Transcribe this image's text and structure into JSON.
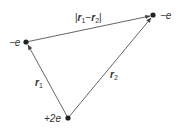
{
  "diagram": {
    "type": "vector-triangle",
    "charges": [
      {
        "id": "left",
        "label": "−e",
        "x": 26,
        "y": 42
      },
      {
        "id": "right",
        "label": "−e",
        "x": 153,
        "y": 15
      },
      {
        "id": "bottom",
        "label": "+2e",
        "x": 68,
        "y": 118
      }
    ],
    "vectors": [
      {
        "id": "r1",
        "label": "r",
        "sub": "1",
        "from": "bottom",
        "to": "left"
      },
      {
        "id": "r2",
        "label": "r",
        "sub": "2",
        "from": "bottom",
        "to": "right"
      },
      {
        "id": "r12",
        "label": "|r1−r2|",
        "from": "left",
        "to": "right"
      }
    ],
    "labels": {
      "left_charge": "−e",
      "right_charge": "−e",
      "bottom_charge": "+2e",
      "r1": "r",
      "r1_sub": "1",
      "r2": "r",
      "r2_sub": "2",
      "diff_bar_left": "|",
      "diff_r1": "r",
      "diff_r1_sub": "1",
      "diff_minus": "−",
      "diff_r2": "r",
      "diff_r2_sub": "2",
      "diff_bar_right": "|"
    },
    "colors": {
      "line": "#555555",
      "dot": "#222222",
      "text": "#333333"
    }
  }
}
